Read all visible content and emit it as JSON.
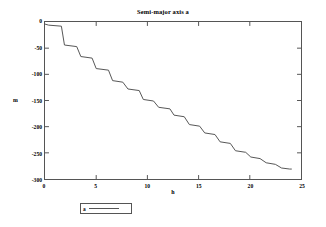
{
  "chart_data": {
    "type": "line",
    "title": "Semi-major axis a",
    "xlabel": "h",
    "ylabel": "m",
    "xlim": [
      0,
      25
    ],
    "ylim": [
      -300,
      0
    ],
    "grid": false,
    "legend_position": "below-plot",
    "line_color": "#555555",
    "drawstyle": "steps-post",
    "xticks": [
      0,
      5,
      10,
      15,
      20,
      25
    ],
    "xtick_labels": [
      "0",
      "5",
      "10",
      "15",
      "20",
      "25"
    ],
    "yticks": [
      0,
      -50,
      -100,
      -150,
      -200,
      -250,
      -300
    ],
    "ytick_labels": [
      "0",
      "-50",
      "-100",
      "-150",
      "-200",
      "-250",
      "-300"
    ],
    "series": [
      {
        "name": "a",
        "x": [
          0.0,
          0.35,
          1.6,
          1.9,
          3.1,
          3.5,
          4.6,
          5.0,
          6.2,
          6.6,
          7.6,
          8.1,
          9.2,
          9.6,
          10.6,
          11.1,
          12.2,
          12.6,
          13.6,
          14.1,
          15.1,
          15.6,
          16.6,
          17.1,
          18.1,
          18.6,
          19.6,
          20.1,
          21.0,
          21.6,
          22.5,
          23.1,
          23.9,
          24.1
        ],
        "y": [
          -4,
          -6,
          -8,
          -44,
          -47,
          -66,
          -69,
          -89,
          -92,
          -112,
          -115,
          -128,
          -131,
          -148,
          -151,
          -163,
          -166,
          -178,
          -181,
          -196,
          -199,
          -212,
          -215,
          -229,
          -232,
          -246,
          -249,
          -258,
          -261,
          -269,
          -272,
          -279,
          -281,
          -281
        ]
      }
    ],
    "annotations": []
  },
  "legend": {
    "entries": [
      {
        "label": "a"
      }
    ]
  }
}
